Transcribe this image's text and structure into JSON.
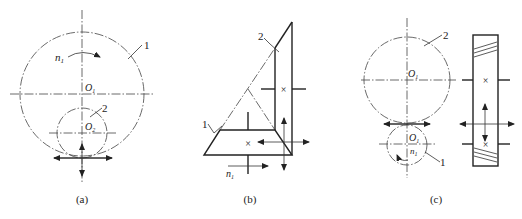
{
  "figure": {
    "panels": [
      {
        "id": "a",
        "caption": "(a)",
        "type": "internal gear meshing",
        "labels": {
          "speed": "n",
          "speed_sub": "1",
          "gear1": "1",
          "gear2": "2",
          "center1": "O",
          "center1_sub": "1",
          "center2": "O",
          "center2_sub": "2"
        }
      },
      {
        "id": "b",
        "caption": "(b)",
        "type": "bevel gear meshing",
        "labels": {
          "speed": "n",
          "speed_sub": "1",
          "gear1": "1",
          "gear2": "2"
        }
      },
      {
        "id": "c",
        "caption": "(c)",
        "type": "helical gear meshing",
        "labels": {
          "speed": "n",
          "speed_sub": "1",
          "gear1": "1",
          "gear2": "2",
          "center2": "O",
          "center2_sub": "1",
          "center1": "O",
          "center1_sub": "1"
        }
      }
    ]
  }
}
